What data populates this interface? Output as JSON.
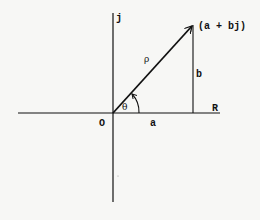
{
  "diagram": {
    "type": "complex-plane-phasor",
    "axes": {
      "real_label": "R",
      "imag_label": "j",
      "origin_label": "O"
    },
    "vector": {
      "magnitude_label": "ρ",
      "angle_label": "θ",
      "point_label": "(a + bj)"
    },
    "components": {
      "real_part_label": "a",
      "imag_part_label": "b"
    },
    "colors": {
      "ink": "#111111",
      "background": "#f7f7f5"
    }
  }
}
